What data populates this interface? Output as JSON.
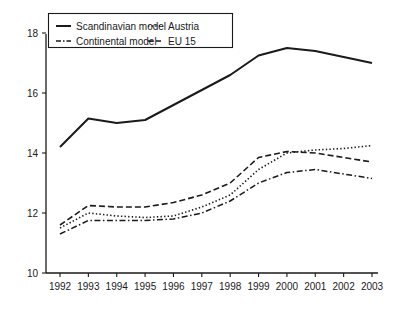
{
  "chart_data": {
    "type": "line",
    "title": "",
    "subtitle": "",
    "xlabel": "",
    "ylabel": "",
    "categories": [
      "1992",
      "1993",
      "1994",
      "1995",
      "1996",
      "1997",
      "1998",
      "1999",
      "2000",
      "2001",
      "2002",
      "2003"
    ],
    "xlim": [
      1992,
      2003
    ],
    "ylim": [
      10,
      18
    ],
    "yticks": [
      10,
      12,
      14,
      16,
      18
    ],
    "ytick_labels": [
      "10",
      "12",
      "14",
      "16",
      "18"
    ],
    "xticks": [
      1992,
      1993,
      1994,
      1995,
      1996,
      1997,
      1998,
      1999,
      2000,
      2001,
      2002,
      2003
    ],
    "grid": false,
    "legend_position": "top-left",
    "series": [
      {
        "name": "Scandinavian model",
        "style": "solid",
        "values": [
          14.2,
          15.15,
          15.0,
          15.1,
          15.6,
          16.1,
          16.6,
          17.25,
          17.5,
          17.4,
          17.2,
          17.0
        ]
      },
      {
        "name": "Continental model",
        "style": "dashdot",
        "values": [
          11.3,
          11.75,
          11.75,
          11.75,
          11.8,
          12.0,
          12.4,
          13.0,
          13.35,
          13.45,
          13.3,
          13.15
        ]
      },
      {
        "name": "Austria",
        "style": "dotted",
        "values": [
          11.5,
          12.0,
          11.9,
          11.85,
          11.9,
          12.2,
          12.6,
          13.45,
          14.0,
          14.1,
          14.15,
          14.25
        ]
      },
      {
        "name": "EU 15",
        "style": "dashed",
        "values": [
          11.6,
          12.25,
          12.2,
          12.2,
          12.35,
          12.6,
          13.0,
          13.85,
          14.05,
          14.0,
          13.85,
          13.7
        ]
      }
    ]
  },
  "legend": {
    "entries": [
      {
        "label": "Scandinavian model",
        "style": "solid"
      },
      {
        "label": "Continental model",
        "style": "dashdot"
      },
      {
        "label": "Austria",
        "style": "dotted"
      },
      {
        "label": "EU 15",
        "style": "dashed"
      }
    ]
  }
}
